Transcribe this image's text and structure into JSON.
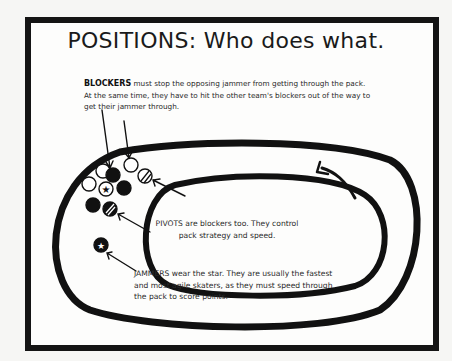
{
  "title": "POSITIONS: Who does what.",
  "blockers": {
    "label": "BLOCKERS",
    "text": " must stop the opposing jammer from getting through the pack. At the same time, they have to hit the other team's blockers out of the way to get their jammer through."
  },
  "pivots": {
    "text": "PIVOTS are blockers too. They control pack strategy and speed."
  },
  "jammers": {
    "text": "JAMMERS wear the star. They are usually the fastest and most agile skaters, as they must speed through the pack to score points."
  },
  "diagram": {
    "track": "oval roller derby track",
    "skaters": [
      {
        "team": "white",
        "role": "blocker"
      },
      {
        "team": "white",
        "role": "blocker"
      },
      {
        "team": "white",
        "role": "blocker"
      },
      {
        "team": "white",
        "role": "jammer",
        "mark": "star"
      },
      {
        "team": "white",
        "role": "pivot",
        "mark": "stripe"
      },
      {
        "team": "black",
        "role": "blocker"
      },
      {
        "team": "black",
        "role": "blocker"
      },
      {
        "team": "black",
        "role": "blocker"
      },
      {
        "team": "black",
        "role": "pivot",
        "mark": "stripe"
      },
      {
        "team": "black",
        "role": "jammer",
        "mark": "star"
      }
    ],
    "direction": "counter-clockwise"
  }
}
